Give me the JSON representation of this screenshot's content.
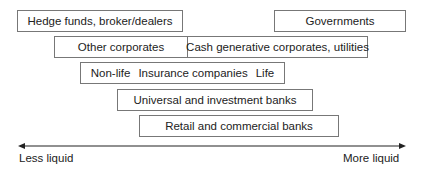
{
  "diagram": {
    "boxes": {
      "hedge_funds": "Hedge funds, broker/dealers",
      "governments": "Governments",
      "other_corporates": "Other corporates",
      "cash_generative": "Cash generative corporates, utilities",
      "insurance": {
        "nonlife": "Non-life",
        "title": "Insurance companies",
        "life": "Life"
      },
      "universal": "Universal and investment banks",
      "retail": "Retail and commercial banks"
    },
    "axis": {
      "left_label": "Less liquid",
      "right_label": "More liquid"
    }
  }
}
